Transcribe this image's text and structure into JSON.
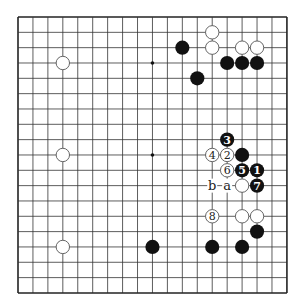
{
  "board": {
    "size": 19,
    "origin_x": 18,
    "origin_y": 17,
    "spacing_x": 14.94,
    "spacing_y": 15.33,
    "stone_radius": 7.1,
    "line_color": "#333333",
    "edge_color": "#222222",
    "black_color": "#111111",
    "white_fill": "#ffffff",
    "white_stroke": "#555555"
  },
  "star_points": [
    {
      "col": 9,
      "row": 3
    },
    {
      "col": 9,
      "row": 9
    }
  ],
  "stones": [
    {
      "col": 3,
      "row": 3,
      "color": "white"
    },
    {
      "col": 3,
      "row": 9,
      "color": "white"
    },
    {
      "col": 3,
      "row": 15,
      "color": "white"
    },
    {
      "col": 13,
      "row": 1,
      "color": "white"
    },
    {
      "col": 13,
      "row": 2,
      "color": "white"
    },
    {
      "col": 11,
      "row": 2,
      "color": "black"
    },
    {
      "col": 15,
      "row": 2,
      "color": "white"
    },
    {
      "col": 16,
      "row": 2,
      "color": "white"
    },
    {
      "col": 14,
      "row": 3,
      "color": "black"
    },
    {
      "col": 15,
      "row": 3,
      "color": "black"
    },
    {
      "col": 16,
      "row": 3,
      "color": "black"
    },
    {
      "col": 12,
      "row": 4,
      "color": "black"
    },
    {
      "col": 14,
      "row": 8,
      "color": "black",
      "label": "3"
    },
    {
      "col": 13,
      "row": 9,
      "color": "white",
      "label": "4"
    },
    {
      "col": 14,
      "row": 9,
      "color": "white",
      "label": "2"
    },
    {
      "col": 15,
      "row": 9,
      "color": "black"
    },
    {
      "col": 14,
      "row": 10,
      "color": "white",
      "label": "6"
    },
    {
      "col": 15,
      "row": 10,
      "color": "black",
      "label": "5"
    },
    {
      "col": 16,
      "row": 10,
      "color": "black",
      "label": "1"
    },
    {
      "col": 15,
      "row": 11,
      "color": "white"
    },
    {
      "col": 16,
      "row": 11,
      "color": "black",
      "label": "7"
    },
    {
      "col": 13,
      "row": 13,
      "color": "white",
      "label": "8"
    },
    {
      "col": 15,
      "row": 13,
      "color": "white"
    },
    {
      "col": 16,
      "row": 13,
      "color": "white"
    },
    {
      "col": 16,
      "row": 14,
      "color": "black"
    },
    {
      "col": 9,
      "row": 15,
      "color": "black"
    },
    {
      "col": 13,
      "row": 15,
      "color": "black"
    },
    {
      "col": 15,
      "row": 15,
      "color": "black"
    }
  ],
  "letter_marks": [
    {
      "col": 13,
      "row": 11,
      "text": "b"
    },
    {
      "col": 14,
      "row": 11,
      "text": "a"
    }
  ]
}
